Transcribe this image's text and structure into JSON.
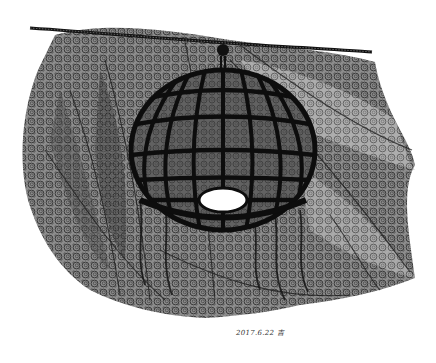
{
  "artwork": {
    "subject": "pen-and-ink drawing of a hanging spherical lattice lamp against a textured fabric of swirls",
    "signature_date": "2017.6.22",
    "signature_mark": "吉",
    "colors": {
      "background": "#ffffff",
      "ink": "#111111",
      "texture_dark": "#4a4a4a",
      "texture_mid": "#7a7a7a",
      "texture_light": "#a8a8a8",
      "lamp_opening": "#ffffff"
    }
  }
}
